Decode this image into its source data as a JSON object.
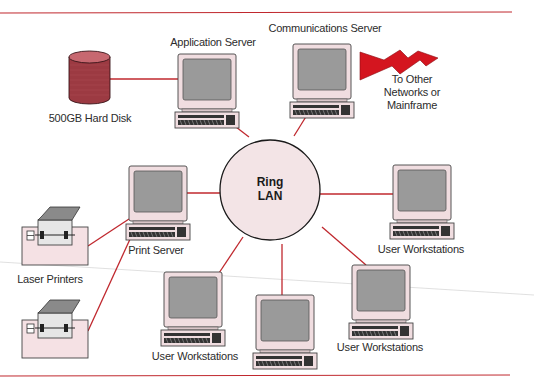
{
  "diagram": {
    "type": "ring-lan-network",
    "colors": {
      "link_line": "#c0282e",
      "rule_line": "#c0282e",
      "ring_fill": "#f3e4e6",
      "ring_stroke": "#1a1a1a",
      "computer_case": "#f0dde0",
      "computer_screen": "#9a9a9a",
      "disk_fill": "#9c3a42",
      "bolt_fill": "#d4151f",
      "printer_body": "#f5e1e4",
      "printer_lid": "#8a8a8a"
    },
    "hub": {
      "id": "ring-lan",
      "label_line1": "Ring",
      "label_line2": "LAN"
    },
    "nodes": [
      {
        "id": "application-server",
        "kind": "computer",
        "label": "Application Server"
      },
      {
        "id": "communications-server",
        "kind": "computer",
        "label": "Communications Server"
      },
      {
        "id": "hard-disk",
        "kind": "disk",
        "label": "500GB Hard Disk"
      },
      {
        "id": "external-link",
        "kind": "lightning",
        "label_lines": [
          "To Other",
          "Networks or",
          "Mainframe"
        ]
      },
      {
        "id": "print-server",
        "kind": "computer",
        "label": "Print Server"
      },
      {
        "id": "workstation-right",
        "kind": "computer",
        "label": "User Workstations"
      },
      {
        "id": "workstation-bottom-right",
        "kind": "computer",
        "label": "User Workstations"
      },
      {
        "id": "workstation-bottom-center",
        "kind": "computer",
        "label": ""
      },
      {
        "id": "workstation-bottom-left",
        "kind": "computer",
        "label": "User Workstations"
      },
      {
        "id": "printer-top",
        "kind": "printer",
        "label": ""
      },
      {
        "id": "printer-bottom",
        "kind": "printer",
        "label": ""
      },
      {
        "id": "printers-group",
        "kind": "label",
        "label": "Laser Printers"
      }
    ],
    "edges": [
      [
        "ring-lan",
        "application-server"
      ],
      [
        "ring-lan",
        "communications-server"
      ],
      [
        "ring-lan",
        "print-server"
      ],
      [
        "ring-lan",
        "workstation-right"
      ],
      [
        "ring-lan",
        "workstation-bottom-right"
      ],
      [
        "ring-lan",
        "workstation-bottom-center"
      ],
      [
        "ring-lan",
        "workstation-bottom-left"
      ],
      [
        "application-server",
        "hard-disk"
      ],
      [
        "print-server",
        "printer-top"
      ],
      [
        "print-server",
        "printer-bottom"
      ],
      [
        "communications-server",
        "external-link"
      ]
    ]
  }
}
